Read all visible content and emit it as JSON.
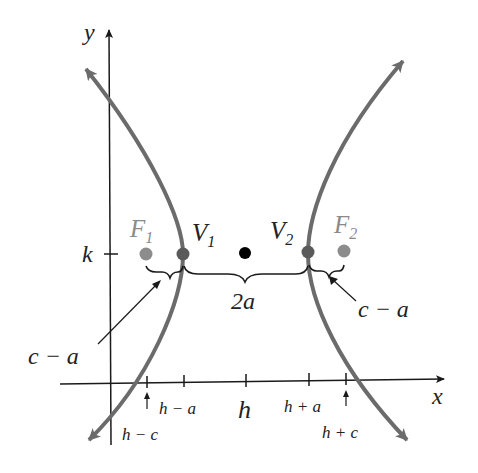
{
  "diagram": {
    "axes": {
      "x_label": "x",
      "y_label": "y"
    },
    "y_tick_label": "k",
    "x_ticks": [
      {
        "label": "h − c",
        "position": "below-arrow"
      },
      {
        "label": "h − a",
        "position": "below"
      },
      {
        "label": "h",
        "position": "below"
      },
      {
        "label": "h + a",
        "position": "below"
      },
      {
        "label": "h + c",
        "position": "below-arrow"
      }
    ],
    "points": [
      {
        "name": "F",
        "sub": "1",
        "role": "focus",
        "color": "#8c8c8c"
      },
      {
        "name": "V",
        "sub": "1",
        "role": "vertex",
        "color": "#5a5a5a"
      },
      {
        "name": "",
        "sub": "",
        "role": "center",
        "color": "#000000"
      },
      {
        "name": "V",
        "sub": "2",
        "role": "vertex",
        "color": "#5a5a5a"
      },
      {
        "name": "F",
        "sub": "2",
        "role": "focus",
        "color": "#8c8c8c"
      }
    ],
    "annotations": {
      "transverse": "2a",
      "left_gap": "c − a",
      "right_gap": "c − a"
    },
    "colors": {
      "curve": "#6b6b6b",
      "axis": "#1a1a1a",
      "focus": "#8c8c8c",
      "vertex": "#5a5a5a",
      "center": "#000000"
    }
  }
}
